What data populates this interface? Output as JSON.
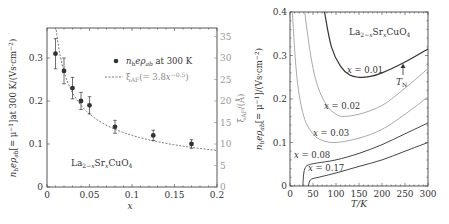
{
  "chart_data": [
    {
      "type": "scatter",
      "title": "",
      "xlabel": "x",
      "ylabel": "n_h e ρ_ab [= μ^-1] at 300 K / (Vs·cm^-2)",
      "y2label": "ξ_AF / (Å)",
      "xlim": [
        0,
        0.2
      ],
      "ylim": [
        0,
        0.37
      ],
      "y2lim": [
        0,
        37
      ],
      "xticks": [
        "0",
        "0.05",
        "0.1",
        "0.15",
        "0.2"
      ],
      "yticks": [
        "0",
        "0.1",
        "0.2",
        "0.3"
      ],
      "y2ticks": [
        "0",
        "5",
        "10",
        "15",
        "20",
        "25",
        "30",
        "35"
      ],
      "grid": false,
      "legend_position": "upper right",
      "annotation": "La2−xSrxCuO4",
      "series": [
        {
          "name": "n_h e ρ_ab at 300 K",
          "style": "filled-circle-with-errorbars",
          "x": [
            0.01,
            0.02,
            0.03,
            0.04,
            0.05,
            0.08,
            0.125,
            0.17
          ],
          "y": [
            0.31,
            0.27,
            0.23,
            0.2,
            0.19,
            0.14,
            0.12,
            0.1
          ],
          "yerr": [
            0.035,
            0.03,
            0.025,
            0.02,
            0.02,
            0.015,
            0.012,
            0.01
          ]
        },
        {
          "name": "ξ_AF (= 3.8x^-0.5)",
          "style": "dotted-line",
          "axis": "right",
          "x": [
            0.011,
            0.02,
            0.03,
            0.04,
            0.05,
            0.08,
            0.1,
            0.125,
            0.15,
            0.17,
            0.2
          ],
          "y": [
            36.2,
            26.9,
            21.9,
            19.0,
            17.0,
            13.4,
            12.0,
            10.7,
            9.8,
            9.2,
            8.5
          ]
        }
      ]
    },
    {
      "type": "line",
      "title": "",
      "xlabel": "T/K",
      "ylabel": "n_h e ρ_ab [= μ^-1] / (Vs·cm^-2)",
      "xlim": [
        0,
        300
      ],
      "ylim": [
        0,
        0.4
      ],
      "xticks": [
        "0",
        "50",
        "100",
        "150",
        "200",
        "250",
        "300"
      ],
      "yticks": [
        "0",
        "0.1",
        "0.2",
        "0.3",
        "0.4"
      ],
      "grid": false,
      "annotation": "La2−xSrxCuO4",
      "annotation_TN": "T_N",
      "series": [
        {
          "name": "x = 0.01",
          "x": [
            75,
            90,
            110,
            130,
            150,
            175,
            200,
            250,
            300
          ],
          "y": [
            0.4,
            0.32,
            0.275,
            0.255,
            0.25,
            0.252,
            0.26,
            0.285,
            0.315
          ]
        },
        {
          "name": "x = 0.02",
          "x": [
            32,
            45,
            60,
            80,
            100,
            115,
            150,
            200,
            250,
            300
          ],
          "y": [
            0.4,
            0.3,
            0.23,
            0.185,
            0.165,
            0.16,
            0.165,
            0.185,
            0.225,
            0.27
          ]
        },
        {
          "name": "x = 0.03",
          "x": [
            5,
            15,
            30,
            50,
            70,
            100,
            150,
            200,
            250,
            300
          ],
          "y": [
            0.4,
            0.25,
            0.16,
            0.12,
            0.105,
            0.1,
            0.11,
            0.13,
            0.165,
            0.205
          ]
        },
        {
          "name": "x = 0.08",
          "x": [
            28,
            30,
            35,
            45,
            60,
            100,
            150,
            200,
            250,
            300
          ],
          "y": [
            0.0,
            0.03,
            0.045,
            0.05,
            0.053,
            0.06,
            0.075,
            0.095,
            0.12,
            0.145
          ]
        },
        {
          "name": "x = 0.17",
          "x": [
            40,
            43,
            50,
            70,
            100,
            150,
            200,
            250,
            300
          ],
          "y": [
            0.0,
            0.012,
            0.017,
            0.022,
            0.03,
            0.045,
            0.06,
            0.08,
            0.1
          ]
        }
      ]
    }
  ],
  "left_chart": {
    "y_ticks": [
      "0",
      "0.1",
      "0.2",
      "0.3"
    ],
    "y2_ticks": [
      "0",
      "5",
      "10",
      "15",
      "20",
      "25",
      "30",
      "35"
    ],
    "x_ticks": [
      "0",
      "0.05",
      "0.1",
      "0.15",
      "0.2"
    ],
    "x_label": "x",
    "y_label": "n_h e ρ_ab [= μ⁻¹] at 300 K/(Vs·cm⁻²)",
    "y2_label": "ξ_AF/(Å)",
    "legend_series1": "n_h e ρ_ab at 300 K",
    "legend_series2": "ξ_AF(= 3.8x^−0.5)",
    "annotation": "La₂₋ₓSrₓCuO₄"
  },
  "right_chart": {
    "y_ticks": [
      "0",
      "0.1",
      "0.2",
      "0.3",
      "0.4"
    ],
    "x_ticks": [
      "0",
      "50",
      "100",
      "150",
      "200",
      "250",
      "300"
    ],
    "x_label": "T/K",
    "y_label": "n_h e ρ_ab [= μ⁻¹]/(Vs·cm⁻²)",
    "annotation": "La₂₋ₓSrₓCuO₄",
    "tn_label": "T_N",
    "curve_labels": [
      "x = 0.01",
      "x = 0.02",
      "x = 0.03",
      "x = 0.08",
      "x = 0.17"
    ]
  }
}
